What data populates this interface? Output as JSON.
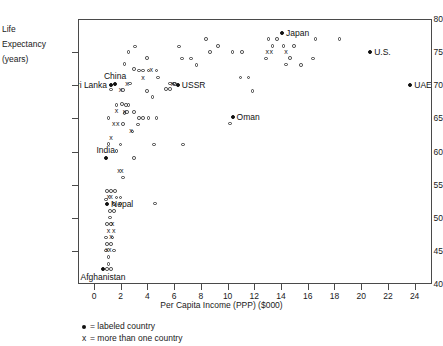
{
  "chart_data": {
    "type": "scatter",
    "title": "",
    "xlabel": "Per Capita Income (PPP) ($000)",
    "ylabel": "Life Expectancy (years)",
    "ylabel_lines": [
      "Life",
      "Expectancy",
      "(years)"
    ],
    "xlim": [
      -1.2,
      25.3
    ],
    "ylim": [
      40,
      80
    ],
    "xticks": [
      0,
      2,
      4,
      6,
      8,
      10,
      12,
      14,
      16,
      18,
      20,
      22,
      24
    ],
    "yticks": [
      40,
      45,
      50,
      55,
      60,
      65,
      70,
      75,
      80
    ],
    "grid": false,
    "legend_position": "below-axes-left",
    "legend": [
      {
        "glyph": "filled-dot",
        "label": "= labeled country"
      },
      {
        "glyph": "x",
        "label": "= more than one country"
      }
    ],
    "marker_styles": {
      "single": "open-circle",
      "multiple": "x",
      "labeled": "filled-dot"
    },
    "labeled_points": [
      {
        "name": "Japan",
        "x": 14.0,
        "y": 78.0,
        "anchor": "right"
      },
      {
        "name": "U.S.",
        "x": 20.6,
        "y": 75.2,
        "anchor": "right"
      },
      {
        "name": "UAE",
        "x": 23.6,
        "y": 70.2,
        "anchor": "right"
      },
      {
        "name": "Oman",
        "x": 10.3,
        "y": 65.3,
        "anchor": "right"
      },
      {
        "name": "USSR",
        "x": 6.2,
        "y": 70.2,
        "anchor": "right"
      },
      {
        "name": "China",
        "x": 1.5,
        "y": 70.3,
        "anchor": "above"
      },
      {
        "name": "Sri Lanka",
        "x": 1.2,
        "y": 70.2,
        "anchor": "left"
      },
      {
        "name": "India",
        "x": 0.8,
        "y": 59.2,
        "anchor": "above"
      },
      {
        "name": "Nepal",
        "x": 0.9,
        "y": 52.3,
        "anchor": "right"
      },
      {
        "name": "Afghanistan",
        "x": 0.6,
        "y": 42.4,
        "anchor": "below"
      }
    ],
    "points_single": [
      [
        2.5,
        75.2
      ],
      [
        3.0,
        76.0
      ],
      [
        2.2,
        73.4
      ],
      [
        2.9,
        72.6
      ],
      [
        3.3,
        72.4
      ],
      [
        3.6,
        72.4
      ],
      [
        4.0,
        72.4
      ],
      [
        4.6,
        72.4
      ],
      [
        3.9,
        74.3
      ],
      [
        4.7,
        71.3
      ],
      [
        5.6,
        70.4
      ],
      [
        5.9,
        70.4
      ],
      [
        6.0,
        70.3
      ],
      [
        5.3,
        69.6
      ],
      [
        5.6,
        69.6
      ],
      [
        4.3,
        68.4
      ],
      [
        3.9,
        69.3
      ],
      [
        2.1,
        69.4
      ],
      [
        6.5,
        74.2
      ],
      [
        7.2,
        74.2
      ],
      [
        6.3,
        76.0
      ],
      [
        7.6,
        73.2
      ],
      [
        8.3,
        77.1
      ],
      [
        8.6,
        75.2
      ],
      [
        9.2,
        76.1
      ],
      [
        10.3,
        75.2
      ],
      [
        11.0,
        75.2
      ],
      [
        10.9,
        71.3
      ],
      [
        11.5,
        71.3
      ],
      [
        11.8,
        69.3
      ],
      [
        10.1,
        64.4
      ],
      [
        12.8,
        74.2
      ],
      [
        13.0,
        77.1
      ],
      [
        13.6,
        77.1
      ],
      [
        14.3,
        73.3
      ],
      [
        14.6,
        74.3
      ],
      [
        14.1,
        76.1
      ],
      [
        14.9,
        76.1
      ],
      [
        15.4,
        73.2
      ],
      [
        16.3,
        74.2
      ],
      [
        16.5,
        77.1
      ],
      [
        18.3,
        77.1
      ],
      [
        13.3,
        76.1
      ],
      [
        1.0,
        65.2
      ],
      [
        1.6,
        67.2
      ],
      [
        2.3,
        67.2
      ],
      [
        2.2,
        66.0
      ],
      [
        2.4,
        66.1
      ],
      [
        2.9,
        66.1
      ],
      [
        3.3,
        65.2
      ],
      [
        3.6,
        65.2
      ],
      [
        4.0,
        65.2
      ],
      [
        4.6,
        65.2
      ],
      [
        3.2,
        64.2
      ],
      [
        2.8,
        63.2
      ],
      [
        1.0,
        61.3
      ],
      [
        1.9,
        61.2
      ],
      [
        4.4,
        61.2
      ],
      [
        6.6,
        61.2
      ],
      [
        1.6,
        60.2
      ],
      [
        2.9,
        59.2
      ],
      [
        2.1,
        56.2
      ],
      [
        0.9,
        54.2
      ],
      [
        1.2,
        54.2
      ],
      [
        1.5,
        54.2
      ],
      [
        1.6,
        53.2
      ],
      [
        1.9,
        53.2
      ],
      [
        0.8,
        52.9
      ],
      [
        1.4,
        52.2
      ],
      [
        1.9,
        52.2
      ],
      [
        4.5,
        52.3
      ],
      [
        1.1,
        51.2
      ],
      [
        1.4,
        51.2
      ],
      [
        1.1,
        50.2
      ],
      [
        0.9,
        49.2
      ],
      [
        1.2,
        49.2
      ],
      [
        0.8,
        47.2
      ],
      [
        1.3,
        47.2
      ],
      [
        0.9,
        46.2
      ],
      [
        1.2,
        46.2
      ],
      [
        0.8,
        45.2
      ],
      [
        1.4,
        45.2
      ],
      [
        1.0,
        44.2
      ],
      [
        1.0,
        43.2
      ],
      [
        0.9,
        42.4
      ],
      [
        1.2,
        42.4
      ],
      [
        2.6,
        70.4
      ],
      [
        1.2,
        69.5
      ],
      [
        2.0,
        67.3
      ],
      [
        2.5,
        67.2
      ],
      [
        2.1,
        64.3
      ]
    ],
    "points_multi": [
      [
        4.2,
        72.5
      ],
      [
        3.6,
        71.3
      ],
      [
        2.4,
        70.4
      ],
      [
        1.9,
        69.4
      ],
      [
        14.3,
        75.2
      ],
      [
        2.2,
        66.1
      ],
      [
        2.7,
        63.3
      ],
      [
        1.2,
        62.2
      ],
      [
        1.8,
        57.2
      ],
      [
        2.0,
        57.2
      ],
      [
        1.0,
        53.3
      ],
      [
        1.2,
        53.3
      ],
      [
        1.3,
        49.2
      ],
      [
        1.0,
        48.2
      ],
      [
        1.4,
        48.2
      ],
      [
        1.2,
        47.3
      ],
      [
        0.9,
        45.3
      ],
      [
        1.1,
        45.3
      ],
      [
        12.9,
        75.2
      ],
      [
        13.2,
        75.2
      ],
      [
        5.8,
        70.3
      ],
      [
        1.6,
        66.2
      ],
      [
        1.4,
        64.3
      ],
      [
        1.7,
        64.3
      ]
    ]
  }
}
